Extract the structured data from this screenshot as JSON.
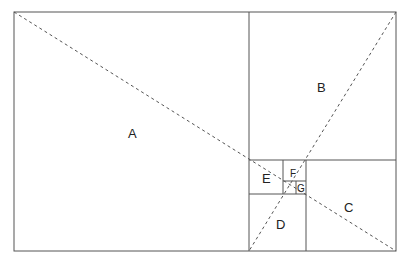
{
  "diagram": {
    "type": "golden-rectangle-subdivision",
    "regions": [
      {
        "id": "A",
        "label": "A"
      },
      {
        "id": "B",
        "label": "B"
      },
      {
        "id": "C",
        "label": "C"
      },
      {
        "id": "D",
        "label": "D"
      },
      {
        "id": "E",
        "label": "E"
      },
      {
        "id": "F",
        "label": "F"
      },
      {
        "id": "G",
        "label": "G"
      }
    ],
    "colors": {
      "line": "#555555",
      "dash": "#555555",
      "text": "#222222"
    }
  }
}
